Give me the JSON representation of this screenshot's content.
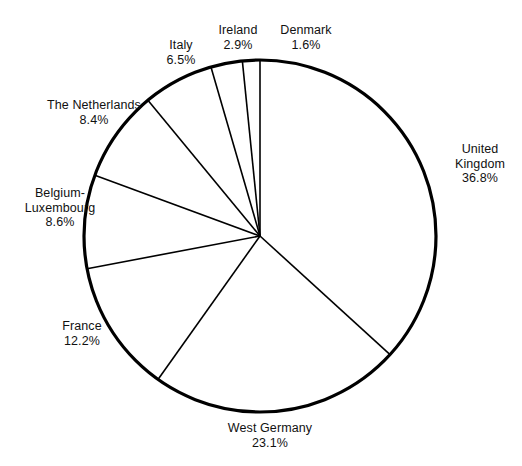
{
  "figure": {
    "background_color": "#ffffff",
    "stroke_color": "#000000",
    "outline_width_px": 3.2,
    "spoke_width_px": 1.6,
    "center": {
      "x": 260,
      "y": 236
    },
    "radius": 176
  },
  "chart_data": {
    "type": "pie",
    "title": "",
    "subtitle": "",
    "xlabel": "",
    "ylabel": "",
    "start_angle_deg": 0,
    "direction": "clockwise",
    "units": "percent",
    "legend": "none",
    "grid": false,
    "labels_outside": true,
    "categories": [
      "United Kingdom",
      "West Germany",
      "France",
      "Belgium-Luxembourg",
      "The Netherlands",
      "Italy",
      "Ireland",
      "Denmark"
    ],
    "values": [
      36.8,
      23.1,
      12.2,
      8.6,
      8.4,
      6.5,
      2.9,
      1.6
    ],
    "value_labels": [
      "36.8%",
      "23.1%",
      "12.2%",
      "8.6%",
      "8.4%",
      "6.5%",
      "2.9%",
      "1.6%"
    ],
    "total": 101.1,
    "slice_colors": [
      "#ffffff",
      "#ffffff",
      "#ffffff",
      "#ffffff",
      "#ffffff",
      "#ffffff",
      "#ffffff",
      "#ffffff"
    ]
  },
  "labels": [
    {
      "id": "united-kingdom",
      "name_lines": [
        "United",
        "Kingdom"
      ],
      "name": "United Kingdom",
      "percent": "36.8%"
    },
    {
      "id": "west-germany",
      "name_lines": [
        "West Germany"
      ],
      "name": "West Germany",
      "percent": "23.1%"
    },
    {
      "id": "france",
      "name_lines": [
        "France"
      ],
      "name": "France",
      "percent": "12.2%"
    },
    {
      "id": "belgium-luxembourg",
      "name_lines": [
        "Belgium-",
        "Luxembourg"
      ],
      "name": "Belgium-Luxembourg",
      "percent": "8.6%"
    },
    {
      "id": "the-netherlands",
      "name_lines": [
        "The Netherlands"
      ],
      "name": "The Netherlands",
      "percent": "8.4%"
    },
    {
      "id": "italy",
      "name_lines": [
        "Italy"
      ],
      "name": "Italy",
      "percent": "6.5%"
    },
    {
      "id": "ireland",
      "name_lines": [
        "Ireland"
      ],
      "name": "Ireland",
      "percent": "2.9%"
    },
    {
      "id": "denmark",
      "name_lines": [
        "Denmark"
      ],
      "name": "Denmark",
      "percent": "1.6%"
    }
  ],
  "label_text": {
    "united_kingdom_l1": "United",
    "united_kingdom_l2": "Kingdom",
    "united_kingdom_pct": "36.8%",
    "west_germany_l1": "West Germany",
    "west_germany_pct": "23.1%",
    "france_l1": "France",
    "france_pct": "12.2%",
    "belgium_l1": "Belgium-",
    "belgium_l2": "Luxembourg",
    "belgium_pct": "8.6%",
    "netherlands_l1": "The Netherlands",
    "netherlands_pct": "8.4%",
    "italy_l1": "Italy",
    "italy_pct": "6.5%",
    "ireland_l1": "Ireland",
    "ireland_pct": "2.9%",
    "denmark_l1": "Denmark",
    "denmark_pct": "1.6%"
  }
}
